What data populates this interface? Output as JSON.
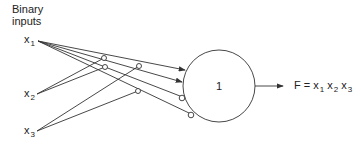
{
  "title": {
    "line1": "Binary",
    "line2": "inputs"
  },
  "inputs": [
    {
      "name": "x",
      "sub": "1"
    },
    {
      "name": "x",
      "sub": "2"
    },
    {
      "name": "x",
      "sub": "3"
    }
  ],
  "neuron": {
    "threshold": "1"
  },
  "output": {
    "label": "F =",
    "terms": [
      {
        "name": "x",
        "sub": "1"
      },
      {
        "name": "x",
        "sub": "2"
      },
      {
        "name": "x",
        "sub": "3"
      }
    ]
  },
  "colors": {
    "stroke": "#333333",
    "background": "#ffffff"
  }
}
